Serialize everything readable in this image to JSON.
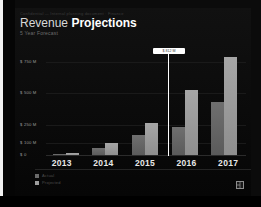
{
  "window": {
    "edge_strip": "window-edge"
  },
  "slide": {
    "micro_header": "Confidential — Internal planning document · Finance",
    "title_plain": "Revenue ",
    "title_bold": "Projections",
    "subtitle": "5 Year Forecast",
    "logo": "company-logo-icon"
  },
  "callout": {
    "text": "$ 812 M",
    "label": "value-tooltip"
  },
  "legend": {
    "items": [
      {
        "label": "Actual",
        "color": "#6a6a6a",
        "swatch": "legend-swatch-series-1"
      },
      {
        "label": "Projected",
        "color": "#9e9e9e",
        "swatch": "legend-swatch-series-2"
      }
    ]
  },
  "chart_data": {
    "type": "bar",
    "title": "Revenue Projections",
    "subtitle": "5 Year Forecast",
    "xlabel": "",
    "ylabel": "",
    "categories": [
      "2013",
      "2014",
      "2015",
      "2016",
      "2017"
    ],
    "series": [
      {
        "name": "Actual",
        "color": "#6a6a6a",
        "values": [
          15,
          60,
          165,
          230,
          430
        ]
      },
      {
        "name": "Projected",
        "color": "#9e9e9e",
        "values": [
          20,
          105,
          265,
          525,
          790
        ]
      }
    ],
    "ytick_labels": [
      "$ 750 M",
      "$ 500 M",
      "$ 250 M",
      "$ 100 M",
      "$ 0"
    ],
    "ytick_values": [
      750,
      500,
      250,
      100,
      0
    ],
    "ylim": [
      0,
      830
    ],
    "grid": true,
    "legend_position": "bottom-left",
    "annotations": [
      {
        "text": "$ 812 M",
        "attached_to": "2016",
        "type": "callout"
      }
    ]
  }
}
